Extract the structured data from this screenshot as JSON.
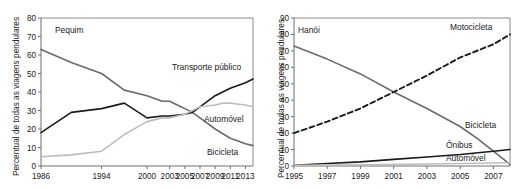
{
  "figure": {
    "panels": [
      {
        "id": "beijing",
        "city_label": "Pequim",
        "ylabel": "Percentual de todas as viagens pendulares"
      },
      {
        "id": "hanoi",
        "city_label": "Hanói",
        "ylabel": "Percentual de todas as viagens pendulares"
      }
    ]
  },
  "chart_data": [
    {
      "type": "line",
      "title": "Pequim",
      "xlabel": "",
      "ylabel": "Percentual de todas as viagens pendulares",
      "categories": [
        "1986",
        "1994",
        "2000",
        "2003",
        "2005",
        "2007",
        "2009",
        "2011",
        "2013"
      ],
      "x": [
        1986,
        1994,
        2000,
        2003,
        2005,
        2007,
        2009,
        2011,
        2013
      ],
      "xlim": [
        1986,
        2014
      ],
      "ylim": [
        0,
        80
      ],
      "yticks": [
        0,
        10,
        20,
        30,
        40,
        50,
        60,
        70,
        80
      ],
      "xticks": [
        1986,
        1994,
        2000,
        2003,
        2005,
        2007,
        2009,
        2011,
        2013
      ],
      "grid": false,
      "legend": "inline-labels",
      "series": [
        {
          "name": "Bicicleta",
          "color": "#6b6b6b",
          "style": "solid",
          "label_pos": "right",
          "points": [
            {
              "year": 1986,
              "value": 63
            },
            {
              "year": 1990,
              "value": 56
            },
            {
              "year": 1994,
              "value": 50
            },
            {
              "year": 1997,
              "value": 41
            },
            {
              "year": 2000,
              "value": 38
            },
            {
              "year": 2002,
              "value": 35
            },
            {
              "year": 2003,
              "value": 35
            },
            {
              "year": 2004,
              "value": 33
            },
            {
              "year": 2005,
              "value": 31
            },
            {
              "year": 2006,
              "value": 29
            },
            {
              "year": 2007,
              "value": 26
            },
            {
              "year": 2009,
              "value": 20
            },
            {
              "year": 2011,
              "value": 15
            },
            {
              "year": 2013,
              "value": 12
            },
            {
              "year": 2014,
              "value": 11
            }
          ]
        },
        {
          "name": "Transporte público",
          "color": "#1a1a1a",
          "style": "solid",
          "label_pos": "right",
          "points": [
            {
              "year": 1986,
              "value": 18
            },
            {
              "year": 1990,
              "value": 29
            },
            {
              "year": 1994,
              "value": 31
            },
            {
              "year": 1997,
              "value": 34
            },
            {
              "year": 2000,
              "value": 26
            },
            {
              "year": 2002,
              "value": 27
            },
            {
              "year": 2003,
              "value": 27
            },
            {
              "year": 2005,
              "value": 28
            },
            {
              "year": 2006,
              "value": 29
            },
            {
              "year": 2007,
              "value": 32
            },
            {
              "year": 2009,
              "value": 38
            },
            {
              "year": 2011,
              "value": 42
            },
            {
              "year": 2013,
              "value": 45
            },
            {
              "year": 2014,
              "value": 47
            }
          ]
        },
        {
          "name": "Automóvel",
          "color": "#bdbdbd",
          "style": "solid",
          "label_pos": "right",
          "points": [
            {
              "year": 1986,
              "value": 5
            },
            {
              "year": 1990,
              "value": 6
            },
            {
              "year": 1994,
              "value": 8
            },
            {
              "year": 1997,
              "value": 17
            },
            {
              "year": 2000,
              "value": 24
            },
            {
              "year": 2002,
              "value": 26
            },
            {
              "year": 2003,
              "value": 26
            },
            {
              "year": 2005,
              "value": 28
            },
            {
              "year": 2006,
              "value": 30
            },
            {
              "year": 2007,
              "value": 32
            },
            {
              "year": 2009,
              "value": 33
            },
            {
              "year": 2010,
              "value": 34
            },
            {
              "year": 2011,
              "value": 34
            },
            {
              "year": 2013,
              "value": 33
            },
            {
              "year": 2014,
              "value": 32
            }
          ]
        }
      ]
    },
    {
      "type": "line",
      "title": "Hanói",
      "xlabel": "",
      "ylabel": "Percentual de todas as viagens pendulares",
      "categories": [
        "1995",
        "1997",
        "1999",
        "2001",
        "2003",
        "2005",
        "2007"
      ],
      "x": [
        1995,
        1997,
        1999,
        2001,
        2003,
        2005,
        2007
      ],
      "xlim": [
        1995,
        2008
      ],
      "ylim": [
        0,
        90
      ],
      "yticks": [
        0,
        10,
        20,
        30,
        40,
        50,
        60,
        70,
        80,
        90
      ],
      "xticks": [
        1995,
        1997,
        1999,
        2001,
        2003,
        2005,
        2007
      ],
      "grid": false,
      "legend": "inline-labels",
      "series": [
        {
          "name": "Bicicleta",
          "color": "#6b6b6b",
          "style": "solid",
          "label_pos": "right",
          "points": [
            {
              "year": 1995,
              "value": 73
            },
            {
              "year": 1997,
              "value": 65
            },
            {
              "year": 1999,
              "value": 56
            },
            {
              "year": 2001,
              "value": 45
            },
            {
              "year": 2003,
              "value": 35
            },
            {
              "year": 2005,
              "value": 24
            },
            {
              "year": 2006,
              "value": 17
            },
            {
              "year": 2007,
              "value": 9
            },
            {
              "year": 2008,
              "value": 1
            }
          ]
        },
        {
          "name": "Motocicleta",
          "color": "#1a1a1a",
          "style": "dashed",
          "label_pos": "right",
          "points": [
            {
              "year": 1995,
              "value": 20
            },
            {
              "year": 1997,
              "value": 27
            },
            {
              "year": 1999,
              "value": 35
            },
            {
              "year": 2001,
              "value": 45
            },
            {
              "year": 2003,
              "value": 55
            },
            {
              "year": 2005,
              "value": 66
            },
            {
              "year": 2007,
              "value": 74
            },
            {
              "year": 2008,
              "value": 80
            }
          ]
        },
        {
          "name": "Ônibus",
          "color": "#1a1a1a",
          "style": "solid",
          "label_pos": "right",
          "points": [
            {
              "year": 1995,
              "value": 0.5
            },
            {
              "year": 1997,
              "value": 1.5
            },
            {
              "year": 1999,
              "value": 2.5
            },
            {
              "year": 2001,
              "value": 4
            },
            {
              "year": 2003,
              "value": 5.5
            },
            {
              "year": 2005,
              "value": 7
            },
            {
              "year": 2007,
              "value": 9
            },
            {
              "year": 2008,
              "value": 10
            }
          ]
        },
        {
          "name": "Automóvel",
          "color": "#bdbdbd",
          "style": "solid",
          "label_pos": "right",
          "points": [
            {
              "year": 1995,
              "value": 0.4
            },
            {
              "year": 1999,
              "value": 0.8
            },
            {
              "year": 2003,
              "value": 1.2
            },
            {
              "year": 2005,
              "value": 1.5
            },
            {
              "year": 2008,
              "value": 2
            }
          ]
        }
      ]
    }
  ]
}
